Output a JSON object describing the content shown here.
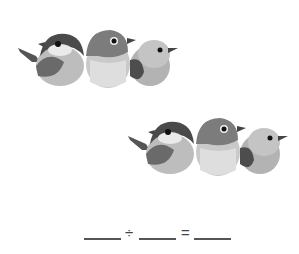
{
  "worksheet": {
    "groups": [
      {
        "name": "bird-group-1",
        "bird_count": 3
      },
      {
        "name": "bird-group-2",
        "bird_count": 3
      }
    ],
    "equation": {
      "blank1": "",
      "operator1": "÷",
      "blank2": "",
      "operator2": "=",
      "blank3": ""
    }
  }
}
